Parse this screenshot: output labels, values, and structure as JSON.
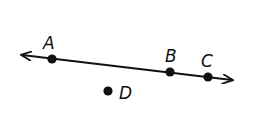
{
  "diagram": {
    "type": "geometry-line",
    "line": {
      "name": "line through A, B, C",
      "start": [
        22,
        55
      ],
      "end": [
        232,
        80
      ],
      "arrows": "both",
      "color": "#111111"
    },
    "points": [
      {
        "id": "A",
        "label": "A",
        "x": 52,
        "y": 59,
        "label_x": 43,
        "label_y": 49,
        "on_line": true
      },
      {
        "id": "B",
        "label": "B",
        "x": 170,
        "y": 72,
        "label_x": 165,
        "label_y": 62,
        "on_line": true
      },
      {
        "id": "C",
        "label": "C",
        "x": 208,
        "y": 77,
        "label_x": 201,
        "label_y": 67,
        "on_line": true
      },
      {
        "id": "D",
        "label": "D",
        "x": 108,
        "y": 91,
        "label_x": 119,
        "label_y": 99,
        "on_line": false
      }
    ]
  }
}
